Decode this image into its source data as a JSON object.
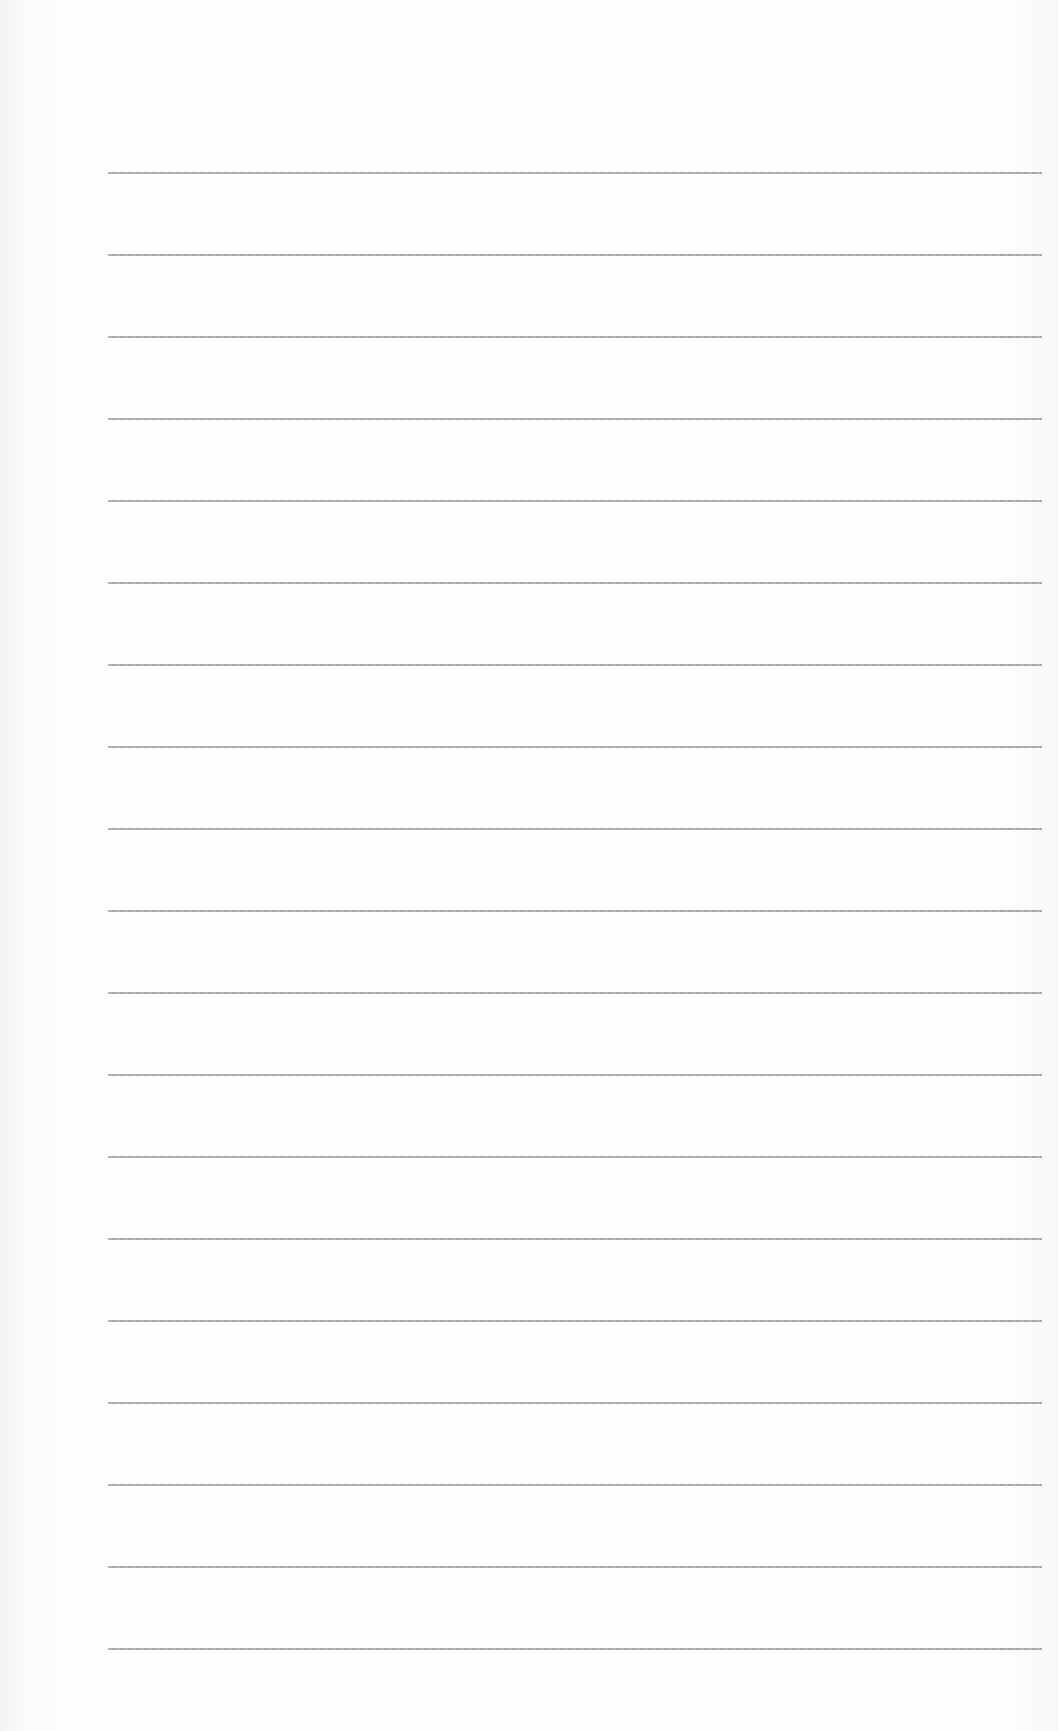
{
  "page": {
    "type": "lined-paper",
    "background_color": "#fdfdfd",
    "line_color": "#9a9a9a",
    "line_count": 19,
    "first_line_y": 172,
    "line_spacing_px": 82,
    "line_left_x": 108,
    "line_right_x": 1042
  }
}
